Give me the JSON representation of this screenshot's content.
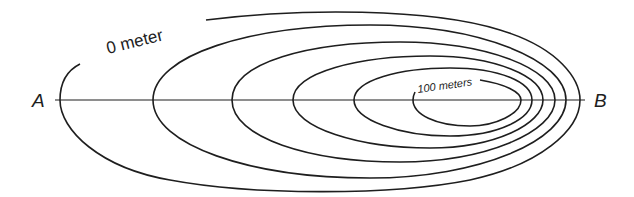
{
  "diagram": {
    "type": "topographic-contour-map",
    "labels": {
      "point_a": "A",
      "point_b": "B",
      "outer_contour": "0 meter",
      "inner_contour": "100 meters"
    },
    "contour_count": 6,
    "profile_line": "A to B",
    "colors": {
      "line": "#1e1e1e",
      "background": "#ffffff"
    }
  }
}
